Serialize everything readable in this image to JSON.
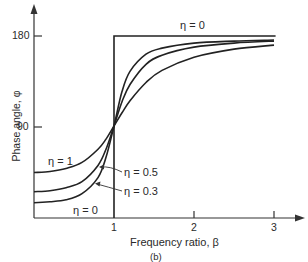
{
  "chart_data": {
    "type": "line",
    "title": "",
    "caption": "(b)",
    "xlabel": "Frequency ratio, β",
    "ylabel": "Phase angle, φ",
    "xlim": [
      0,
      3.2
    ],
    "ylim": [
      0,
      200
    ],
    "x_ticks": [
      "1",
      "2",
      "3"
    ],
    "y_ticks": [
      "90",
      "180"
    ],
    "grid": false,
    "legend_position": "inline annotations",
    "series": [
      {
        "name": "η = 0",
        "x": [
          0,
          1,
          1,
          3
        ],
        "y": [
          0,
          0,
          180,
          180
        ]
      },
      {
        "name": "η = 0.3",
        "x": [
          0,
          0.2,
          0.4,
          0.6,
          0.8,
          0.9,
          1.0,
          1.1,
          1.2,
          1.4,
          1.6,
          2.0,
          2.5,
          3.0
        ],
        "y": [
          15,
          16,
          18,
          24,
          40,
          60,
          91,
          125,
          145,
          162,
          168,
          173,
          175,
          176
        ]
      },
      {
        "name": "η = 0.5",
        "x": [
          0,
          0.2,
          0.4,
          0.6,
          0.8,
          0.9,
          1.0,
          1.1,
          1.2,
          1.4,
          1.6,
          2.0,
          2.5,
          3.0
        ],
        "y": [
          26,
          27,
          30,
          36,
          52,
          68,
          91,
          115,
          132,
          152,
          161,
          169,
          173,
          175
        ]
      },
      {
        "name": "η = 1",
        "x": [
          0,
          0.2,
          0.4,
          0.6,
          0.8,
          0.9,
          1.0,
          1.1,
          1.2,
          1.4,
          1.6,
          2.0,
          2.5,
          3.0
        ],
        "y": [
          45,
          46,
          49,
          55,
          68,
          78,
          91,
          104,
          116,
          134,
          146,
          159,
          167,
          171
        ]
      }
    ],
    "annotations": [
      {
        "text": "η = 0",
        "position": "above top horizontal line"
      },
      {
        "text": "η = 1",
        "position": "above η=1 curve, left"
      },
      {
        "text": "η = 0.5",
        "position": "right of β=1, arrow to curve"
      },
      {
        "text": "η = 0.3",
        "position": "right of β=1, arrow to curve"
      },
      {
        "text": "η = 0",
        "position": "bottom left near x-axis"
      }
    ]
  },
  "labels": {
    "y_axis": "Phase angle, φ",
    "x_axis": "Frequency ratio, β",
    "caption": "(b)",
    "y180": "180",
    "y90": "90",
    "x1": "1",
    "x2": "2",
    "x3": "3",
    "eta0_top": "η = 0",
    "eta1": "η = 1",
    "eta05": "η = 0.5",
    "eta03": "η = 0.3",
    "eta0_bottom": "η = 0"
  }
}
